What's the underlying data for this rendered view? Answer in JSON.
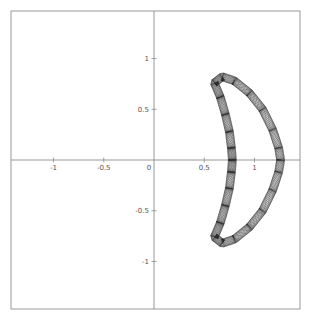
{
  "chart_data": {
    "type": "line",
    "title": "",
    "xlabel": "",
    "ylabel": "",
    "xlim": [
      -1.45,
      1.45
    ],
    "ylim": [
      -1.45,
      1.45
    ],
    "grid": false,
    "legend": "none",
    "axes_through_origin": true,
    "x_ticks": [
      {
        "value": -1,
        "label": "-1"
      },
      {
        "value": -0.5,
        "label": "-0.5"
      },
      {
        "value": 0,
        "label": "0"
      },
      {
        "value": 0.5,
        "label": "0.5"
      },
      {
        "value": 1,
        "label": "1"
      }
    ],
    "y_ticks": [
      {
        "value": 1,
        "label": "1"
      },
      {
        "value": 0.5,
        "label": "0.5"
      },
      {
        "value": -0.5,
        "label": "-0.5"
      },
      {
        "value": -1,
        "label": "-1"
      }
    ],
    "series": [
      {
        "name": "quasi-periodic orbit band (crescent)",
        "description": "Closed crescent-shaped band of many overlapping orbit loops, symmetric about the x-axis",
        "outer_boundary": {
          "x": [
            0.6,
            0.68,
            0.8,
            0.95,
            1.08,
            1.18,
            1.24,
            1.26,
            1.24,
            1.18,
            1.08,
            0.95,
            0.8,
            0.68,
            0.6
          ],
          "y": [
            0.76,
            0.82,
            0.78,
            0.66,
            0.5,
            0.3,
            0.12,
            0.0,
            -0.12,
            -0.3,
            -0.5,
            -0.66,
            -0.78,
            -0.82,
            -0.76
          ]
        },
        "inner_boundary": {
          "x": [
            0.6,
            0.66,
            0.71,
            0.75,
            0.77,
            0.78,
            0.77,
            0.75,
            0.71,
            0.66,
            0.6
          ],
          "y": [
            0.76,
            0.62,
            0.45,
            0.28,
            0.12,
            0.0,
            -0.12,
            -0.28,
            -0.45,
            -0.62,
            -0.76
          ]
        },
        "band_width": 0.08,
        "loop_count": 14,
        "color": "#222222"
      }
    ]
  }
}
